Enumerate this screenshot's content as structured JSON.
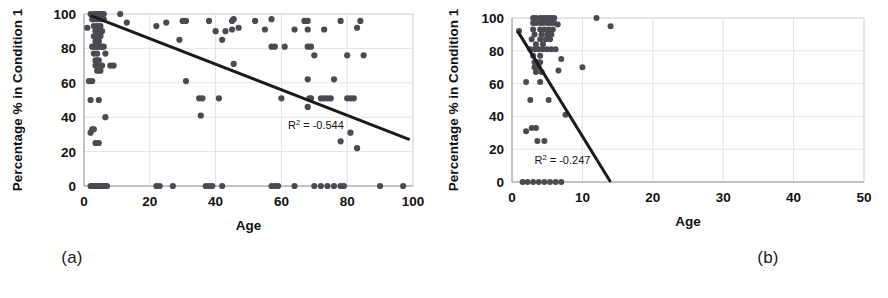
{
  "figure": {
    "panels": [
      {
        "id": "a",
        "caption": "(a)",
        "xlabel": "Age",
        "ylabel": "Percentage % in Condition 1",
        "annotation": "R2 = -0.544",
        "annotation_prefix": "R",
        "annotation_sup": "2",
        "annotation_suffix": " = -0.544"
      },
      {
        "id": "b",
        "caption": "(b)",
        "xlabel": "Age",
        "ylabel": "Percentage % in Condition 1",
        "annotation": "R2 = -0.247",
        "annotation_prefix": "R",
        "annotation_sup": "2",
        "annotation_suffix": " = -0.247"
      }
    ]
  },
  "colors": {
    "point": "#4a4a52",
    "trendline": "#1b1b1b",
    "grid": "#e3e3e8",
    "axis": "#9a9aa2",
    "text": "#111111",
    "background": "#ffffff"
  },
  "chart_data": [
    {
      "type": "scatter",
      "panel": "a",
      "title": "",
      "xlabel": "Age",
      "ylabel": "Percentage % in Condition 1",
      "xlim": [
        0,
        100
      ],
      "ylim": [
        0,
        100
      ],
      "xticks": [
        0,
        20,
        40,
        60,
        80,
        100
      ],
      "yticks": [
        0,
        20,
        40,
        60,
        80,
        100
      ],
      "grid": true,
      "legend": "none",
      "annotations": [
        {
          "text": "R2 = -0.544",
          "x": 62,
          "y": 33
        }
      ],
      "trendline": {
        "x": [
          2,
          99
        ],
        "y": [
          99,
          27
        ],
        "r2_label": "-0.544"
      },
      "points": [
        {
          "x": 1,
          "y": 92
        },
        {
          "x": 2,
          "y": 100
        },
        {
          "x": 2.5,
          "y": 97
        },
        {
          "x": 3,
          "y": 100
        },
        {
          "x": 3,
          "y": 97
        },
        {
          "x": 3.5,
          "y": 100
        },
        {
          "x": 4,
          "y": 100
        },
        {
          "x": 4,
          "y": 97
        },
        {
          "x": 4.5,
          "y": 100
        },
        {
          "x": 5,
          "y": 100
        },
        {
          "x": 5,
          "y": 97
        },
        {
          "x": 5.5,
          "y": 100
        },
        {
          "x": 6,
          "y": 100
        },
        {
          "x": 6,
          "y": 97
        },
        {
          "x": 3,
          "y": 93
        },
        {
          "x": 4,
          "y": 93
        },
        {
          "x": 5,
          "y": 93
        },
        {
          "x": 3.5,
          "y": 90
        },
        {
          "x": 4.5,
          "y": 90
        },
        {
          "x": 5.5,
          "y": 90
        },
        {
          "x": 3,
          "y": 87
        },
        {
          "x": 4,
          "y": 87
        },
        {
          "x": 5,
          "y": 87
        },
        {
          "x": 3.5,
          "y": 84
        },
        {
          "x": 4.5,
          "y": 84
        },
        {
          "x": 2.5,
          "y": 81
        },
        {
          "x": 3,
          "y": 81
        },
        {
          "x": 3.5,
          "y": 81
        },
        {
          "x": 4,
          "y": 81
        },
        {
          "x": 4.5,
          "y": 81
        },
        {
          "x": 5,
          "y": 81
        },
        {
          "x": 5.5,
          "y": 81
        },
        {
          "x": 6,
          "y": 81
        },
        {
          "x": 3,
          "y": 77
        },
        {
          "x": 4,
          "y": 77
        },
        {
          "x": 6.5,
          "y": 77
        },
        {
          "x": 3.5,
          "y": 73
        },
        {
          "x": 4,
          "y": 73
        },
        {
          "x": 4.5,
          "y": 73
        },
        {
          "x": 3.5,
          "y": 70
        },
        {
          "x": 4,
          "y": 70
        },
        {
          "x": 5.5,
          "y": 70
        },
        {
          "x": 8,
          "y": 70
        },
        {
          "x": 4,
          "y": 67
        },
        {
          "x": 5,
          "y": 67
        },
        {
          "x": 1.5,
          "y": 61
        },
        {
          "x": 2.5,
          "y": 61
        },
        {
          "x": 2,
          "y": 50
        },
        {
          "x": 4.5,
          "y": 50
        },
        {
          "x": 6.5,
          "y": 40
        },
        {
          "x": 2,
          "y": 31
        },
        {
          "x": 2.5,
          "y": 33
        },
        {
          "x": 3,
          "y": 33
        },
        {
          "x": 3.5,
          "y": 25
        },
        {
          "x": 4.5,
          "y": 25
        },
        {
          "x": 9,
          "y": 70
        },
        {
          "x": 11,
          "y": 100
        },
        {
          "x": 13,
          "y": 95
        },
        {
          "x": 22,
          "y": 93
        },
        {
          "x": 25,
          "y": 95
        },
        {
          "x": 29,
          "y": 85
        },
        {
          "x": 30,
          "y": 96
        },
        {
          "x": 31,
          "y": 96
        },
        {
          "x": 31,
          "y": 61
        },
        {
          "x": 35,
          "y": 51
        },
        {
          "x": 36,
          "y": 51
        },
        {
          "x": 35.5,
          "y": 41
        },
        {
          "x": 38,
          "y": 96
        },
        {
          "x": 40,
          "y": 90
        },
        {
          "x": 41,
          "y": 51
        },
        {
          "x": 42,
          "y": 85
        },
        {
          "x": 43,
          "y": 90
        },
        {
          "x": 45,
          "y": 96
        },
        {
          "x": 45.5,
          "y": 97
        },
        {
          "x": 45,
          "y": 91
        },
        {
          "x": 45.5,
          "y": 71
        },
        {
          "x": 47,
          "y": 92
        },
        {
          "x": 52,
          "y": 96
        },
        {
          "x": 55,
          "y": 91
        },
        {
          "x": 57,
          "y": 81
        },
        {
          "x": 58,
          "y": 81
        },
        {
          "x": 57,
          "y": 97
        },
        {
          "x": 60,
          "y": 51
        },
        {
          "x": 61,
          "y": 81
        },
        {
          "x": 64,
          "y": 91
        },
        {
          "x": 67,
          "y": 96
        },
        {
          "x": 68,
          "y": 96
        },
        {
          "x": 68,
          "y": 91
        },
        {
          "x": 68,
          "y": 81
        },
        {
          "x": 69,
          "y": 81
        },
        {
          "x": 68,
          "y": 62
        },
        {
          "x": 68.5,
          "y": 51
        },
        {
          "x": 69,
          "y": 51
        },
        {
          "x": 68,
          "y": 46
        },
        {
          "x": 70,
          "y": 76
        },
        {
          "x": 72,
          "y": 51
        },
        {
          "x": 73,
          "y": 51
        },
        {
          "x": 74,
          "y": 51
        },
        {
          "x": 75,
          "y": 51
        },
        {
          "x": 73,
          "y": 91
        },
        {
          "x": 76,
          "y": 62
        },
        {
          "x": 78,
          "y": 96
        },
        {
          "x": 78,
          "y": 26
        },
        {
          "x": 80,
          "y": 51
        },
        {
          "x": 81,
          "y": 51
        },
        {
          "x": 82,
          "y": 51
        },
        {
          "x": 81,
          "y": 31
        },
        {
          "x": 80,
          "y": 76
        },
        {
          "x": 83,
          "y": 92
        },
        {
          "x": 83,
          "y": 22
        },
        {
          "x": 84,
          "y": 96
        },
        {
          "x": 85,
          "y": 76
        },
        {
          "x": 2,
          "y": 0
        },
        {
          "x": 2.5,
          "y": 0
        },
        {
          "x": 3,
          "y": 0
        },
        {
          "x": 3.5,
          "y": 0
        },
        {
          "x": 4,
          "y": 0
        },
        {
          "x": 4.5,
          "y": 0
        },
        {
          "x": 5,
          "y": 0
        },
        {
          "x": 5.5,
          "y": 0
        },
        {
          "x": 6,
          "y": 0
        },
        {
          "x": 6.5,
          "y": 0
        },
        {
          "x": 7,
          "y": 0
        },
        {
          "x": 22,
          "y": 0
        },
        {
          "x": 23,
          "y": 0
        },
        {
          "x": 27,
          "y": 0
        },
        {
          "x": 37,
          "y": 0
        },
        {
          "x": 38,
          "y": 0
        },
        {
          "x": 39,
          "y": 0
        },
        {
          "x": 42,
          "y": 0
        },
        {
          "x": 57,
          "y": 0
        },
        {
          "x": 58,
          "y": 0
        },
        {
          "x": 59,
          "y": 0
        },
        {
          "x": 64,
          "y": 0
        },
        {
          "x": 70,
          "y": 0
        },
        {
          "x": 72,
          "y": 0
        },
        {
          "x": 74,
          "y": 0
        },
        {
          "x": 76,
          "y": 0
        },
        {
          "x": 78,
          "y": 0
        },
        {
          "x": 79,
          "y": 0
        },
        {
          "x": 90,
          "y": 0
        },
        {
          "x": 97,
          "y": 0
        }
      ]
    },
    {
      "type": "scatter",
      "panel": "b",
      "title": "",
      "xlabel": "Age",
      "ylabel": "Percentage % in Condition 1",
      "xlim": [
        0,
        50
      ],
      "ylim": [
        0,
        100
      ],
      "xticks": [
        0,
        10,
        20,
        30,
        40,
        50
      ],
      "yticks": [
        0,
        20,
        40,
        60,
        80,
        100
      ],
      "grid": true,
      "legend": "none",
      "annotations": [
        {
          "text": "R2 = -0.247",
          "x": 3.2,
          "y": 11
        }
      ],
      "trendline": {
        "x": [
          0.8,
          14
        ],
        "y": [
          92,
          0
        ],
        "r2_label": "-0.247"
      },
      "points": [
        {
          "x": 1,
          "y": 92
        },
        {
          "x": 3,
          "y": 100
        },
        {
          "x": 3.4,
          "y": 100
        },
        {
          "x": 4,
          "y": 100
        },
        {
          "x": 4.4,
          "y": 100
        },
        {
          "x": 4.8,
          "y": 100
        },
        {
          "x": 5.2,
          "y": 100
        },
        {
          "x": 5.6,
          "y": 100
        },
        {
          "x": 6,
          "y": 100
        },
        {
          "x": 3,
          "y": 97
        },
        {
          "x": 3.4,
          "y": 97
        },
        {
          "x": 4,
          "y": 97
        },
        {
          "x": 4.4,
          "y": 97
        },
        {
          "x": 5,
          "y": 97
        },
        {
          "x": 5.5,
          "y": 97
        },
        {
          "x": 6,
          "y": 97
        },
        {
          "x": 6.5,
          "y": 96
        },
        {
          "x": 3,
          "y": 93
        },
        {
          "x": 4,
          "y": 93
        },
        {
          "x": 4.6,
          "y": 93
        },
        {
          "x": 5.2,
          "y": 93
        },
        {
          "x": 5.8,
          "y": 93
        },
        {
          "x": 3.2,
          "y": 90
        },
        {
          "x": 4.2,
          "y": 90
        },
        {
          "x": 5,
          "y": 90
        },
        {
          "x": 5.6,
          "y": 90
        },
        {
          "x": 2.8,
          "y": 87
        },
        {
          "x": 4,
          "y": 87
        },
        {
          "x": 4.8,
          "y": 87
        },
        {
          "x": 5.4,
          "y": 87
        },
        {
          "x": 3.4,
          "y": 84
        },
        {
          "x": 4.4,
          "y": 84
        },
        {
          "x": 2.6,
          "y": 81
        },
        {
          "x": 3.2,
          "y": 81
        },
        {
          "x": 3.8,
          "y": 81
        },
        {
          "x": 4.4,
          "y": 81
        },
        {
          "x": 5,
          "y": 81
        },
        {
          "x": 5.6,
          "y": 81
        },
        {
          "x": 6.2,
          "y": 81
        },
        {
          "x": 3,
          "y": 77
        },
        {
          "x": 4,
          "y": 77
        },
        {
          "x": 7,
          "y": 75
        },
        {
          "x": 3.2,
          "y": 73
        },
        {
          "x": 3.6,
          "y": 73
        },
        {
          "x": 4,
          "y": 73
        },
        {
          "x": 3.2,
          "y": 70
        },
        {
          "x": 3.8,
          "y": 70
        },
        {
          "x": 6.6,
          "y": 68
        },
        {
          "x": 10,
          "y": 70
        },
        {
          "x": 3.4,
          "y": 67
        },
        {
          "x": 4.2,
          "y": 67
        },
        {
          "x": 2,
          "y": 61
        },
        {
          "x": 4,
          "y": 61
        },
        {
          "x": 2.6,
          "y": 50
        },
        {
          "x": 5.2,
          "y": 50
        },
        {
          "x": 7.6,
          "y": 41
        },
        {
          "x": 2,
          "y": 31
        },
        {
          "x": 2.8,
          "y": 33
        },
        {
          "x": 3.4,
          "y": 33
        },
        {
          "x": 3.6,
          "y": 25
        },
        {
          "x": 4.6,
          "y": 25
        },
        {
          "x": 12,
          "y": 100
        },
        {
          "x": 14,
          "y": 95
        },
        {
          "x": 1.5,
          "y": 0
        },
        {
          "x": 2.2,
          "y": 0
        },
        {
          "x": 3,
          "y": 0
        },
        {
          "x": 3.8,
          "y": 0
        },
        {
          "x": 4.6,
          "y": 0
        },
        {
          "x": 5.4,
          "y": 0
        },
        {
          "x": 6.2,
          "y": 0
        },
        {
          "x": 7,
          "y": 0
        }
      ]
    }
  ]
}
